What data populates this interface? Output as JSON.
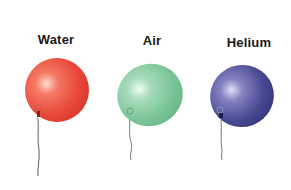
{
  "balloons": [
    {
      "label": "Water",
      "color": "#e8493a",
      "highlight": "#ffd6cc",
      "shade": "#c9302a"
    },
    {
      "label": "Air",
      "color": "#7cc59a",
      "highlight": "#eafaf0",
      "shade": "#5aa67c"
    },
    {
      "label": "Helium",
      "color": "#4a4a94",
      "highlight": "#d6d6f2",
      "shade": "#2f2f74"
    }
  ]
}
